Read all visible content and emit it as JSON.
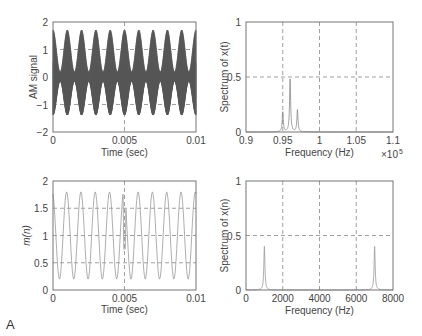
{
  "panel_label": "A",
  "chart_data": [
    {
      "type": "line",
      "id": "am-signal",
      "title": "",
      "xlabel": "Time (sec)",
      "ylabel": "AM signal",
      "xlim": [
        0,
        0.01
      ],
      "ylim": [
        -2,
        2
      ],
      "xticks": [
        "0",
        "0.005",
        "0.01"
      ],
      "yticks": [
        "2",
        "1",
        "0",
        "−1",
        "−2"
      ],
      "grid": true,
      "description": "Amplitude-modulated carrier, envelope 1+0.8cos(2π1000t), carrier ~96 kHz",
      "envelope_freq_hz": 1000,
      "envelope_peak": 1.8,
      "envelope_trough": 0.2
    },
    {
      "type": "line",
      "id": "spectrum-xt",
      "xlabel": "Frequency (Hz)",
      "ylabel": "Spectrum of x(t)",
      "xlim": [
        0.9,
        1.1
      ],
      "x_multiplier": "×10^5",
      "ylim": [
        0,
        1
      ],
      "xticks": [
        "0.9",
        "0.95",
        "1",
        "1.05",
        "1.1"
      ],
      "yticks": [
        "1",
        "0.5",
        "0"
      ],
      "grid": true,
      "peaks": [
        {
          "x": 0.95,
          "y": 0.18
        },
        {
          "x": 0.96,
          "y": 0.48
        },
        {
          "x": 0.97,
          "y": 0.2
        }
      ]
    },
    {
      "type": "line",
      "id": "m-n",
      "xlabel": "Time (sec)",
      "ylabel": "m(n)",
      "xlim": [
        0,
        0.01
      ],
      "ylim": [
        0,
        2
      ],
      "xticks": [
        "0",
        "0.005",
        "0.01"
      ],
      "yticks": [
        "2",
        "1.5",
        "1",
        "0.5",
        "0"
      ],
      "grid": true,
      "frequency_hz": 1000,
      "max": 1.8,
      "min": 0.2
    },
    {
      "type": "line",
      "id": "spectrum-xn",
      "xlabel": "Frequency (Hz)",
      "ylabel": "Spectrum of x(n)",
      "xlim": [
        0,
        8000
      ],
      "ylim": [
        0,
        1
      ],
      "xticks": [
        "0",
        "2000",
        "4000",
        "6000",
        "8000"
      ],
      "yticks": [
        "1",
        "0.5",
        "0"
      ],
      "grid": true,
      "peaks": [
        {
          "x": 1000,
          "y": 0.4
        },
        {
          "x": 7000,
          "y": 0.4
        }
      ]
    }
  ],
  "labels": {
    "tl_x": "Time (sec)",
    "tl_y": "AM signal",
    "tr_x": "Frequency (Hz)",
    "tr_y": "Spectrum of x(t)",
    "tr_mult": "×10",
    "tr_exp": "5",
    "bl_x": "Time (sec)",
    "bl_y": "m(n)",
    "br_x": "Frequency (Hz)",
    "br_y": "Spectrum of x(n)"
  }
}
